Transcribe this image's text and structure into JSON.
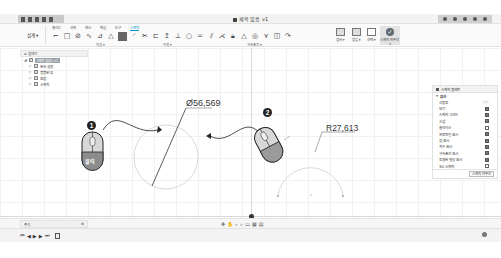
{
  "titlebar": {
    "title": "제목 없음 v1",
    "quick_access": [
      "data-panel-icon",
      "file-icon",
      "save-icon",
      "undo-icon",
      "redo-icon"
    ],
    "right_controls": [
      "job-status-icon",
      "notifications-icon",
      "help-icon",
      "profile-icon",
      "close-icon"
    ]
  },
  "ribbon": {
    "workspace_label": "설계 ▾",
    "tabs": [
      "솔리드",
      "곡면",
      "메시",
      "판금",
      "도구",
      "스케치"
    ],
    "active_tab": "스케치",
    "groups": [
      {
        "label": "작성 ▾",
        "x": 96
      },
      {
        "label": "수정 ▾",
        "x": 163
      },
      {
        "label": "구속조건 ▾",
        "x": 247
      }
    ],
    "tools": [
      "line",
      "rectangle",
      "circle",
      "spline",
      "polygon",
      "triangle",
      "fill",
      "arc",
      "trim",
      "offset",
      "mirror",
      "dimension",
      "horizontal",
      "coincident",
      "equal",
      "parallel",
      "perpendicular",
      "lock",
      "tangent",
      "symmetric",
      "midpoint",
      "curvature"
    ],
    "inspect": [
      {
        "label": "검사 ▾"
      },
      {
        "label": "삽입 ▾"
      },
      {
        "label": "선택 ▾"
      }
    ],
    "finish_sketch": "스케치 마무리 ▾"
  },
  "browser": {
    "header": "검색기",
    "items": [
      {
        "label": "(제목 없음) v1",
        "root": true
      },
      {
        "label": "문서 설정",
        "root": false
      },
      {
        "label": "명명된 뷰",
        "root": false
      },
      {
        "label": "원점",
        "root": false
      },
      {
        "label": "스케치",
        "root": false
      }
    ]
  },
  "palette": {
    "title": "스케치 팔레트",
    "section": "옵션",
    "rows": [
      {
        "label": "선종류",
        "type": "segment",
        "value": "◁ ▷"
      },
      {
        "label": "보기",
        "checked": true
      },
      {
        "label": "스케치 그리드",
        "checked": true
      },
      {
        "label": "스냅",
        "checked": true
      },
      {
        "label": "슬라이스",
        "checked": false
      },
      {
        "label": "프로파일 표시",
        "checked": true
      },
      {
        "label": "점 표시",
        "checked": true
      },
      {
        "label": "치수 표시",
        "checked": true
      },
      {
        "label": "구속조건 표시",
        "checked": true
      },
      {
        "label": "투영된 형상 표시",
        "checked": true
      },
      {
        "label": "3D 스케치",
        "checked": false
      }
    ],
    "finish_button": "스케치 마무리"
  },
  "canvas": {
    "diameter_label": "Ø56,569",
    "radius_label": "R27,613",
    "step1_badge": "1",
    "step2_badge": "2",
    "click_label": "클릭",
    "accent_color": "#333333"
  },
  "bottom": {
    "comments_label": "주석",
    "nav_tools": [
      "orbit-icon",
      "pan-icon",
      "zoom-icon",
      "fit-icon",
      "display-icon",
      "grid-icon",
      "viewport-icon"
    ]
  },
  "timeline": {
    "controls": [
      "⏮",
      "◀",
      "▶",
      "▶",
      "⏭"
    ]
  }
}
